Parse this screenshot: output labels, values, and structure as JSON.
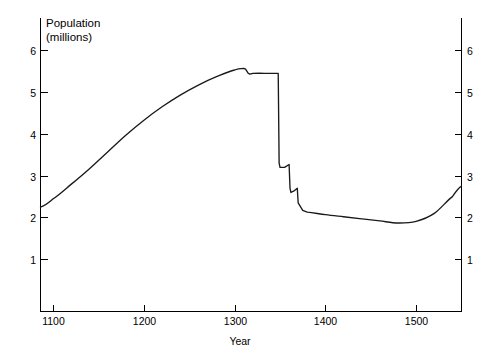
{
  "chart_data": {
    "type": "line",
    "title": "",
    "xlabel": "Year",
    "ylabel_line1": "Population",
    "ylabel_line2": "(millions)",
    "xlim": [
      1086,
      1550
    ],
    "ylim": [
      0,
      6.6
    ],
    "xticks": [
      1100,
      1200,
      1300,
      1400,
      1500
    ],
    "xticklabels": [
      "1100",
      "1200",
      "1300",
      "1400",
      "1500"
    ],
    "yticks": [
      1,
      2,
      3,
      4,
      5,
      6
    ],
    "yticklabels": [
      "1",
      "2",
      "3",
      "4",
      "5",
      "6"
    ],
    "right_axis": true,
    "right_yticks": [
      1,
      2,
      3,
      4,
      5,
      6
    ],
    "right_yticklabels": [
      "1",
      "2",
      "3",
      "4",
      "5",
      "6"
    ],
    "grid": false,
    "legend": "none",
    "line_color": "#1a1a1a",
    "series": [
      {
        "name": "Population of England",
        "x": [
          1086,
          1100,
          1120,
          1140,
          1160,
          1180,
          1200,
          1220,
          1240,
          1260,
          1280,
          1300,
          1310,
          1312,
          1315,
          1317,
          1320,
          1340,
          1347,
          1348,
          1349,
          1350,
          1355,
          1360,
          1361,
          1362,
          1365,
          1369,
          1370,
          1375,
          1380,
          1400,
          1420,
          1440,
          1460,
          1480,
          1500,
          1520,
          1540,
          1550
        ],
        "values": [
          2.5,
          2.7,
          3.05,
          3.42,
          3.82,
          4.22,
          4.58,
          4.9,
          5.18,
          5.42,
          5.62,
          5.78,
          5.82,
          5.8,
          5.7,
          5.68,
          5.7,
          5.7,
          5.7,
          5.7,
          3.55,
          3.45,
          3.45,
          3.52,
          2.95,
          2.85,
          2.88,
          2.95,
          2.6,
          2.42,
          2.38,
          2.32,
          2.27,
          2.22,
          2.17,
          2.12,
          2.16,
          2.35,
          2.75,
          3.0
        ]
      }
    ],
    "annotations": []
  },
  "axes": {
    "ylabel_top": "Population",
    "ylabel_bottom": "(millions)",
    "xaxis_title": "Year"
  }
}
